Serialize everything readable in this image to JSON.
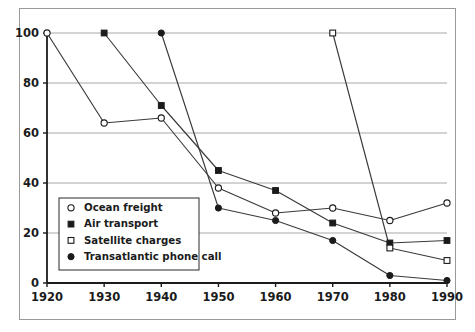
{
  "chart_data": {
    "type": "line",
    "title": "",
    "subtitle": "",
    "xlabel": "",
    "ylabel": "",
    "x": [
      1920,
      1930,
      1940,
      1950,
      1960,
      1970,
      1980,
      1990
    ],
    "xtick_labels": [
      "1920",
      "1930",
      "1940",
      "1950",
      "1960",
      "1970",
      "1980",
      "1990"
    ],
    "ytick_labels": [
      "0",
      "20",
      "40",
      "60",
      "80",
      "100"
    ],
    "yticks": [
      0,
      20,
      40,
      60,
      80,
      100
    ],
    "xlim": [
      1920,
      1990
    ],
    "ylim": [
      0,
      100
    ],
    "grid": "horizontal",
    "legend_position": "lower-left-inside",
    "series": [
      {
        "name": "Ocean freight",
        "marker": "open-circle",
        "color": "#2b2b2b",
        "x": [
          1920,
          1930,
          1940,
          1950,
          1960,
          1970,
          1980,
          1990
        ],
        "values": [
          100,
          64,
          66,
          38,
          28,
          30,
          25,
          32
        ]
      },
      {
        "name": "Air transport",
        "marker": "filled-square",
        "color": "#1b1b1b",
        "x": [
          1930,
          1940,
          1950,
          1960,
          1970,
          1980,
          1990
        ],
        "values": [
          100,
          71,
          45,
          37,
          24,
          16,
          17
        ]
      },
      {
        "name": "Satellite charges",
        "marker": "open-square",
        "color": "#2b2b2b",
        "x": [
          1970,
          1980,
          1990
        ],
        "values": [
          100,
          14,
          9
        ]
      },
      {
        "name": "Transatlantic phone call",
        "marker": "filled-circle",
        "color": "#1b1b1b",
        "x": [
          1940,
          1950,
          1960,
          1970,
          1980,
          1990
        ],
        "values": [
          100,
          30,
          25,
          17,
          3,
          1
        ]
      }
    ],
    "legend_entries": [
      {
        "label": "Ocean freight",
        "marker": "open-circle"
      },
      {
        "label": "Air transport",
        "marker": "filled-square"
      },
      {
        "label": "Satellite charges",
        "marker": "open-square"
      },
      {
        "label": "Transatlantic phone call",
        "marker": "filled-circle"
      }
    ],
    "colors": {
      "axis": "#1b1b1b",
      "grid": "#a8a8a8",
      "series_line": "#3a3a3a",
      "frame": "#9a9a9a",
      "background": "#ffffff",
      "text": "#1b1b1b"
    }
  }
}
